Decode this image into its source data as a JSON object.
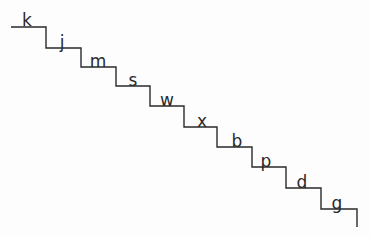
{
  "diagram": {
    "type": "staircase",
    "line_color": "#2a2a2a",
    "background": "#fdfdfd",
    "start": {
      "x": 11,
      "y": 27
    },
    "end_descender": {
      "x": 357,
      "y": 227
    },
    "steps": [
      {
        "letter": "k",
        "y": 27,
        "x_start": 11,
        "x_end": 46,
        "label_x": 27,
        "label_top": 12
      },
      {
        "letter": "j",
        "y": 48,
        "x_start": 46,
        "x_end": 81,
        "label_x": 62,
        "label_top": 34
      },
      {
        "letter": "m",
        "y": 67,
        "x_start": 81,
        "x_end": 116,
        "label_x": 98,
        "label_top": 53
      },
      {
        "letter": "s",
        "y": 86,
        "x_start": 116,
        "x_end": 150,
        "label_x": 133,
        "label_top": 72
      },
      {
        "letter": "w",
        "y": 106,
        "x_start": 150,
        "x_end": 184,
        "label_x": 167,
        "label_top": 92
      },
      {
        "letter": "x",
        "y": 127,
        "x_start": 184,
        "x_end": 217,
        "label_x": 202,
        "label_top": 113
      },
      {
        "letter": "b",
        "y": 147,
        "x_start": 217,
        "x_end": 252,
        "label_x": 237,
        "label_top": 133
      },
      {
        "letter": "p",
        "y": 167,
        "x_start": 252,
        "x_end": 286,
        "label_x": 266,
        "label_top": 153
      },
      {
        "letter": "d",
        "y": 188,
        "x_start": 286,
        "x_end": 321,
        "label_x": 302,
        "label_top": 174
      },
      {
        "letter": "g",
        "y": 209,
        "x_start": 321,
        "x_end": 357,
        "label_x": 337,
        "label_top": 195
      }
    ]
  }
}
